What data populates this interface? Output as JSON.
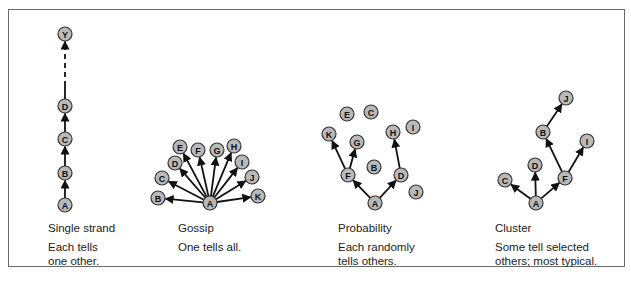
{
  "diagrams": [
    {
      "id": "single-strand",
      "title": "Single strand",
      "description": "Each tells\none other.",
      "caption_pos": [
        48,
        221
      ],
      "nodes": [
        {
          "label": "A",
          "x": 65,
          "y": 205
        },
        {
          "label": "B",
          "x": 65,
          "y": 173
        },
        {
          "label": "C",
          "x": 65,
          "y": 139
        },
        {
          "label": "D",
          "x": 65,
          "y": 106
        },
        {
          "label": "Y",
          "x": 65,
          "y": 34
        }
      ],
      "edges": [
        [
          "A",
          "B"
        ],
        [
          "B",
          "C"
        ],
        [
          "C",
          "D"
        ],
        [
          "D",
          "Y",
          "dashed"
        ]
      ]
    },
    {
      "id": "gossip",
      "title": "Gossip",
      "description": "One tells all.",
      "caption_pos": [
        178,
        221
      ],
      "nodes": [
        {
          "label": "A",
          "x": 210,
          "y": 203
        },
        {
          "label": "B",
          "x": 158,
          "y": 198
        },
        {
          "label": "C",
          "x": 162,
          "y": 178
        },
        {
          "label": "D",
          "x": 175,
          "y": 163
        },
        {
          "label": "E",
          "x": 180,
          "y": 147
        },
        {
          "label": "F",
          "x": 198,
          "y": 150
        },
        {
          "label": "G",
          "x": 217,
          "y": 150
        },
        {
          "label": "H",
          "x": 234,
          "y": 146
        },
        {
          "label": "I",
          "x": 242,
          "y": 162
        },
        {
          "label": "J",
          "x": 252,
          "y": 177
        },
        {
          "label": "K",
          "x": 258,
          "y": 196
        }
      ],
      "edges": [
        [
          "A",
          "B"
        ],
        [
          "A",
          "C"
        ],
        [
          "A",
          "D"
        ],
        [
          "A",
          "E"
        ],
        [
          "A",
          "F"
        ],
        [
          "A",
          "G"
        ],
        [
          "A",
          "H"
        ],
        [
          "A",
          "I"
        ],
        [
          "A",
          "J"
        ],
        [
          "A",
          "K"
        ]
      ]
    },
    {
      "id": "probability",
      "title": "Probability",
      "description": "Each randomly\ntells others.",
      "caption_pos": [
        338,
        221
      ],
      "nodes": [
        {
          "label": "A",
          "x": 375,
          "y": 203
        },
        {
          "label": "B",
          "x": 374,
          "y": 167
        },
        {
          "label": "C",
          "x": 371,
          "y": 112
        },
        {
          "label": "D",
          "x": 401,
          "y": 175
        },
        {
          "label": "E",
          "x": 347,
          "y": 114
        },
        {
          "label": "F",
          "x": 348,
          "y": 175
        },
        {
          "label": "G",
          "x": 357,
          "y": 142
        },
        {
          "label": "H",
          "x": 393,
          "y": 132
        },
        {
          "label": "I",
          "x": 413,
          "y": 127
        },
        {
          "label": "J",
          "x": 416,
          "y": 192
        },
        {
          "label": "K",
          "x": 329,
          "y": 134
        }
      ],
      "edges": [
        [
          "A",
          "F"
        ],
        [
          "A",
          "D"
        ],
        [
          "F",
          "K"
        ],
        [
          "F",
          "G"
        ],
        [
          "D",
          "H"
        ]
      ]
    },
    {
      "id": "cluster",
      "title": "Cluster",
      "description": "Some tell selected\nothers; most typical.",
      "caption_pos": [
        495,
        221
      ],
      "nodes": [
        {
          "label": "A",
          "x": 536,
          "y": 203
        },
        {
          "label": "B",
          "x": 543,
          "y": 132
        },
        {
          "label": "C",
          "x": 505,
          "y": 180
        },
        {
          "label": "D",
          "x": 535,
          "y": 165
        },
        {
          "label": "F",
          "x": 565,
          "y": 178
        },
        {
          "label": "I",
          "x": 587,
          "y": 141
        },
        {
          "label": "J",
          "x": 566,
          "y": 98
        }
      ],
      "edges": [
        [
          "A",
          "C"
        ],
        [
          "A",
          "D"
        ],
        [
          "A",
          "F"
        ],
        [
          "F",
          "B"
        ],
        [
          "F",
          "I"
        ],
        [
          "B",
          "J"
        ]
      ]
    }
  ],
  "style": {
    "node_fill": "#b9b9b9",
    "node_stroke": "#333333",
    "edge_color": "#111111",
    "node_radius": 7
  }
}
